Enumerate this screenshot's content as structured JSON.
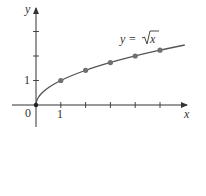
{
  "chart_data": {
    "type": "line",
    "title": "",
    "function_label": "y = √x",
    "label_prefix": "y =",
    "label_radicand": "x",
    "xlabel": "x",
    "ylabel": "y",
    "origin_label": "0",
    "x_tick_label": "1",
    "y_tick_label": "1",
    "x_ticks": [
      1,
      2,
      3,
      4,
      5
    ],
    "y_ticks": [
      1,
      2,
      3
    ],
    "xlim": [
      0,
      6.1
    ],
    "ylim": [
      0,
      4.1
    ],
    "curve": {
      "x_start": 0,
      "x_end": 6
    },
    "points": [
      {
        "x": 0,
        "y": 0
      },
      {
        "x": 1,
        "y": 1
      },
      {
        "x": 2,
        "y": 1.414
      },
      {
        "x": 3,
        "y": 1.732
      },
      {
        "x": 4,
        "y": 2
      },
      {
        "x": 5,
        "y": 2.236
      }
    ],
    "colors": {
      "axis": "#333333",
      "curve": "#555555",
      "points": "#707070"
    }
  }
}
